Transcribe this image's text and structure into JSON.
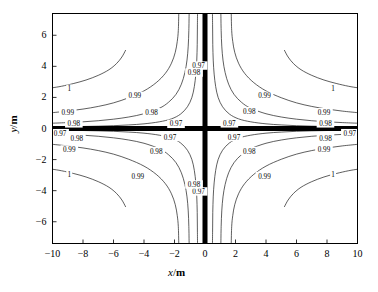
{
  "chart_data": {
    "type": "line",
    "subtype": "contour",
    "title": "",
    "xlabel": "x/m",
    "ylabel": "y/m",
    "xlabel_var": "x",
    "xlabel_sep": "/",
    "xlabel_unit": "m",
    "ylabel_var": "y",
    "ylabel_sep": "/",
    "ylabel_unit": "m",
    "xlim": [
      -10,
      10
    ],
    "ylim": [
      -7.4,
      7.4
    ],
    "xticks": [
      -10,
      -8,
      -6,
      -4,
      -2,
      0,
      2,
      4,
      6,
      8,
      10
    ],
    "xtick_labels": [
      "−10",
      "−8",
      "−6",
      "−4",
      "−2",
      "0",
      "2",
      "4",
      "6",
      "8",
      "10"
    ],
    "yticks": [
      -6,
      -4,
      -2,
      0,
      2,
      4,
      6
    ],
    "ytick_labels": [
      "−6",
      "−4",
      "−2",
      "0",
      "2",
      "4",
      "6"
    ],
    "grid": false,
    "legend": false,
    "tick_direction": "in",
    "contour_levels": [
      1,
      0.99,
      0.98,
      0.97
    ],
    "contour_level_labels": [
      "1",
      "0.99",
      "0.98",
      "0.97"
    ],
    "inline_labels": [
      {
        "text": "1",
        "x": -8.9,
        "y": 2.55
      },
      {
        "text": "0.99",
        "x": -9.0,
        "y": 1.05
      },
      {
        "text": "0.98",
        "x": -8.6,
        "y": 0.33
      },
      {
        "text": "0.97",
        "x": -9.5,
        "y": -0.3
      },
      {
        "text": "0.98",
        "x": -8.4,
        "y": -0.62
      },
      {
        "text": "0.99",
        "x": -8.9,
        "y": -1.35
      },
      {
        "text": "1",
        "x": -8.9,
        "y": -2.95
      },
      {
        "text": "0.99",
        "x": -4.6,
        "y": 2.1
      },
      {
        "text": "0.98",
        "x": -3.5,
        "y": 1.05
      },
      {
        "text": "0.97",
        "x": -1.9,
        "y": 0.3
      },
      {
        "text": "0.97",
        "x": -2.3,
        "y": -0.55
      },
      {
        "text": "0.98",
        "x": -3.2,
        "y": -1.45
      },
      {
        "text": "0.99",
        "x": -4.4,
        "y": -3.05
      },
      {
        "text": "0.99",
        "x": 3.9,
        "y": 2.1
      },
      {
        "text": "0.98",
        "x": 2.9,
        "y": 1.12
      },
      {
        "text": "0.97",
        "x": 1.6,
        "y": 0.33
      },
      {
        "text": "0.97",
        "x": 1.9,
        "y": -0.55
      },
      {
        "text": "0.98",
        "x": 2.9,
        "y": -1.45
      },
      {
        "text": "0.99",
        "x": 3.9,
        "y": -3.05
      },
      {
        "text": "0.99",
        "x": 7.8,
        "y": 1.05
      },
      {
        "text": "0.98",
        "x": 7.9,
        "y": 0.33
      },
      {
        "text": "0.98",
        "x": 7.9,
        "y": -0.62
      },
      {
        "text": "0.99",
        "x": 7.8,
        "y": -1.35
      },
      {
        "text": "1",
        "x": 8.4,
        "y": 2.55
      },
      {
        "text": "1",
        "x": 8.4,
        "y": -2.95
      },
      {
        "text": "0.97",
        "x": 9.5,
        "y": -0.3
      },
      {
        "text": "0.97",
        "x": -0.42,
        "y": 4.05
      },
      {
        "text": "0.97",
        "x": -0.42,
        "y": -4.05
      },
      {
        "text": "0.98",
        "x": -0.72,
        "y": 3.6
      },
      {
        "text": "0.98",
        "x": -0.72,
        "y": -3.6
      }
    ],
    "heavy_axes": {
      "horizontal_y": 0,
      "vertical_x": 0,
      "description": "thick black coordinate axes drawn at x=0 and y=0"
    },
    "series": [
      {
        "name": "level 1 (quadrant II)",
        "level": 1,
        "points": [
          [
            -10,
            2.62
          ],
          [
            -9.4,
            2.72
          ],
          [
            -8.6,
            2.9
          ],
          [
            -7.8,
            3.12
          ],
          [
            -7.0,
            3.42
          ],
          [
            -6.3,
            3.78
          ],
          [
            -5.8,
            4.18
          ],
          [
            -5.45,
            4.6
          ],
          [
            -5.2,
            5.05
          ]
        ]
      },
      {
        "name": "level 1 (quadrant I)",
        "level": 1,
        "points": [
          [
            10,
            2.62
          ],
          [
            9.4,
            2.72
          ],
          [
            8.6,
            2.9
          ],
          [
            7.8,
            3.12
          ],
          [
            7.0,
            3.42
          ],
          [
            6.3,
            3.78
          ],
          [
            5.8,
            4.18
          ],
          [
            5.45,
            4.6
          ],
          [
            5.2,
            5.05
          ]
        ]
      },
      {
        "name": "level 1 (quadrant III)",
        "level": 1,
        "points": [
          [
            -10,
            -2.62
          ],
          [
            -9.4,
            -2.72
          ],
          [
            -8.6,
            -2.9
          ],
          [
            -7.8,
            -3.12
          ],
          [
            -7.0,
            -3.42
          ],
          [
            -6.3,
            -3.78
          ],
          [
            -5.8,
            -4.18
          ],
          [
            -5.45,
            -4.6
          ],
          [
            -5.2,
            -5.05
          ]
        ]
      },
      {
        "name": "level 1 (quadrant IV)",
        "level": 1,
        "points": [
          [
            10,
            -2.62
          ],
          [
            9.4,
            -2.72
          ],
          [
            8.6,
            -2.9
          ],
          [
            7.8,
            -3.12
          ],
          [
            7.0,
            -3.42
          ],
          [
            6.3,
            -3.78
          ],
          [
            5.8,
            -4.18
          ],
          [
            5.45,
            -4.6
          ],
          [
            5.2,
            -5.05
          ]
        ]
      },
      {
        "name": "level 0.99 (upper-left)",
        "level": 0.99,
        "points": [
          [
            -10,
            1.02
          ],
          [
            -9,
            1.12
          ],
          [
            -8,
            1.25
          ],
          [
            -7,
            1.42
          ],
          [
            -6,
            1.65
          ],
          [
            -5,
            1.98
          ],
          [
            -4,
            2.42
          ],
          [
            -3.2,
            2.95
          ],
          [
            -2.6,
            3.55
          ],
          [
            -2.2,
            4.2
          ],
          [
            -1.95,
            4.9
          ],
          [
            -1.82,
            5.6
          ],
          [
            -1.75,
            6.3
          ],
          [
            -1.72,
            7.4
          ]
        ]
      },
      {
        "name": "level 0.99 (upper-right)",
        "level": 0.99,
        "points": [
          [
            10,
            1.02
          ],
          [
            9,
            1.12
          ],
          [
            8,
            1.25
          ],
          [
            7,
            1.42
          ],
          [
            6,
            1.65
          ],
          [
            5,
            1.98
          ],
          [
            4,
            2.42
          ],
          [
            3.2,
            2.95
          ],
          [
            2.6,
            3.55
          ],
          [
            2.2,
            4.2
          ],
          [
            1.95,
            4.9
          ],
          [
            1.82,
            5.6
          ],
          [
            1.75,
            6.3
          ],
          [
            1.72,
            7.4
          ]
        ]
      },
      {
        "name": "level 0.99 (lower-left)",
        "level": 0.99,
        "points": [
          [
            -10,
            -1.02
          ],
          [
            -9,
            -1.12
          ],
          [
            -8,
            -1.25
          ],
          [
            -7,
            -1.42
          ],
          [
            -6,
            -1.65
          ],
          [
            -5,
            -1.98
          ],
          [
            -4,
            -2.42
          ],
          [
            -3.2,
            -2.95
          ],
          [
            -2.6,
            -3.55
          ],
          [
            -2.2,
            -4.2
          ],
          [
            -1.95,
            -4.9
          ],
          [
            -1.82,
            -5.6
          ],
          [
            -1.75,
            -6.3
          ],
          [
            -1.72,
            -7.4
          ]
        ]
      },
      {
        "name": "level 0.99 (lower-right)",
        "level": 0.99,
        "points": [
          [
            10,
            -1.02
          ],
          [
            9,
            -1.12
          ],
          [
            8,
            -1.25
          ],
          [
            7,
            -1.42
          ],
          [
            6,
            -1.65
          ],
          [
            5,
            -1.98
          ],
          [
            4,
            -2.42
          ],
          [
            3.2,
            -2.95
          ],
          [
            2.6,
            -3.55
          ],
          [
            2.2,
            -4.2
          ],
          [
            1.95,
            -4.9
          ],
          [
            1.82,
            -5.6
          ],
          [
            1.75,
            -6.3
          ],
          [
            1.72,
            -7.4
          ]
        ]
      },
      {
        "name": "level 0.98 (upper-left)",
        "level": 0.98,
        "points": [
          [
            -10,
            0.34
          ],
          [
            -9,
            0.38
          ],
          [
            -8,
            0.43
          ],
          [
            -7,
            0.5
          ],
          [
            -6,
            0.6
          ],
          [
            -5,
            0.74
          ],
          [
            -4,
            0.95
          ],
          [
            -3,
            1.3
          ],
          [
            -2.4,
            1.68
          ],
          [
            -1.9,
            2.2
          ],
          [
            -1.55,
            2.85
          ],
          [
            -1.32,
            3.6
          ],
          [
            -1.18,
            4.4
          ],
          [
            -1.1,
            5.3
          ],
          [
            -1.06,
            6.3
          ],
          [
            -1.04,
            7.4
          ]
        ]
      },
      {
        "name": "level 0.98 (upper-right)",
        "level": 0.98,
        "points": [
          [
            10,
            0.34
          ],
          [
            9,
            0.38
          ],
          [
            8,
            0.43
          ],
          [
            7,
            0.5
          ],
          [
            6,
            0.6
          ],
          [
            5,
            0.74
          ],
          [
            4,
            0.95
          ],
          [
            3,
            1.3
          ],
          [
            2.4,
            1.68
          ],
          [
            1.9,
            2.2
          ],
          [
            1.55,
            2.85
          ],
          [
            1.32,
            3.6
          ],
          [
            1.18,
            4.4
          ],
          [
            1.1,
            5.3
          ],
          [
            1.06,
            6.3
          ],
          [
            1.04,
            7.4
          ]
        ]
      },
      {
        "name": "level 0.98 (lower-left)",
        "level": 0.98,
        "points": [
          [
            -10,
            -0.34
          ],
          [
            -9,
            -0.38
          ],
          [
            -8,
            -0.43
          ],
          [
            -7,
            -0.5
          ],
          [
            -6,
            -0.6
          ],
          [
            -5,
            -0.74
          ],
          [
            -4,
            -0.95
          ],
          [
            -3,
            -1.3
          ],
          [
            -2.4,
            -1.68
          ],
          [
            -1.9,
            -2.2
          ],
          [
            -1.55,
            -2.85
          ],
          [
            -1.32,
            -3.6
          ],
          [
            -1.18,
            -4.4
          ],
          [
            -1.1,
            -5.3
          ],
          [
            -1.06,
            -6.3
          ],
          [
            -1.04,
            -7.4
          ]
        ]
      },
      {
        "name": "level 0.98 (lower-right)",
        "level": 0.98,
        "points": [
          [
            10,
            -0.34
          ],
          [
            9,
            -0.38
          ],
          [
            8,
            -0.43
          ],
          [
            7,
            -0.5
          ],
          [
            6,
            -0.6
          ],
          [
            5,
            -0.74
          ],
          [
            4,
            -0.95
          ],
          [
            3,
            -1.3
          ],
          [
            2.4,
            -1.68
          ],
          [
            1.9,
            -2.2
          ],
          [
            1.55,
            -2.85
          ],
          [
            1.32,
            -3.6
          ],
          [
            1.18,
            -4.4
          ],
          [
            1.1,
            -5.3
          ],
          [
            1.06,
            -6.3
          ],
          [
            1.04,
            -7.4
          ]
        ]
      },
      {
        "name": "level 0.97 (upper-left)",
        "level": 0.97,
        "points": [
          [
            -10,
            0.1
          ],
          [
            -9,
            0.11
          ],
          [
            -8,
            0.13
          ],
          [
            -7,
            0.15
          ],
          [
            -6,
            0.18
          ],
          [
            -5,
            0.23
          ],
          [
            -4,
            0.3
          ],
          [
            -3,
            0.43
          ],
          [
            -2.2,
            0.62
          ],
          [
            -1.6,
            0.93
          ],
          [
            -1.15,
            1.4
          ],
          [
            -0.86,
            2.0
          ],
          [
            -0.7,
            2.7
          ],
          [
            -0.6,
            3.5
          ],
          [
            -0.54,
            4.4
          ],
          [
            -0.51,
            5.4
          ],
          [
            -0.5,
            6.4
          ],
          [
            -0.49,
            7.4
          ]
        ]
      },
      {
        "name": "level 0.97 (upper-right)",
        "level": 0.97,
        "points": [
          [
            10,
            0.1
          ],
          [
            9,
            0.11
          ],
          [
            8,
            0.13
          ],
          [
            7,
            0.15
          ],
          [
            6,
            0.18
          ],
          [
            5,
            0.23
          ],
          [
            4,
            0.3
          ],
          [
            3,
            0.43
          ],
          [
            2.2,
            0.62
          ],
          [
            1.6,
            0.93
          ],
          [
            1.15,
            1.4
          ],
          [
            0.86,
            2.0
          ],
          [
            0.7,
            2.7
          ],
          [
            0.6,
            3.5
          ],
          [
            0.54,
            4.4
          ],
          [
            0.51,
            5.4
          ],
          [
            0.5,
            6.4
          ],
          [
            0.49,
            7.4
          ]
        ]
      },
      {
        "name": "level 0.97 (lower-left)",
        "level": 0.97,
        "points": [
          [
            -10,
            -0.1
          ],
          [
            -9,
            -0.11
          ],
          [
            -8,
            -0.13
          ],
          [
            -7,
            -0.15
          ],
          [
            -6,
            -0.18
          ],
          [
            -5,
            -0.23
          ],
          [
            -4,
            -0.3
          ],
          [
            -3,
            -0.43
          ],
          [
            -2.2,
            -0.62
          ],
          [
            -1.6,
            -0.93
          ],
          [
            -1.15,
            -1.4
          ],
          [
            -0.86,
            -2.0
          ],
          [
            -0.7,
            -2.7
          ],
          [
            -0.6,
            -3.5
          ],
          [
            -0.54,
            -4.4
          ],
          [
            -0.51,
            -5.4
          ],
          [
            -0.5,
            -6.4
          ],
          [
            -0.49,
            -7.4
          ]
        ]
      },
      {
        "name": "level 0.97 (lower-right)",
        "level": 0.97,
        "points": [
          [
            10,
            -0.1
          ],
          [
            9,
            -0.11
          ],
          [
            8,
            -0.13
          ],
          [
            7,
            -0.15
          ],
          [
            6,
            -0.18
          ],
          [
            5,
            -0.23
          ],
          [
            4,
            -0.3
          ],
          [
            3,
            -0.43
          ],
          [
            2.2,
            -0.62
          ],
          [
            1.6,
            -0.93
          ],
          [
            1.15,
            -1.4
          ],
          [
            0.86,
            -2.0
          ],
          [
            0.7,
            -2.7
          ],
          [
            0.6,
            -3.5
          ],
          [
            0.54,
            -4.4
          ],
          [
            0.51,
            -5.4
          ],
          [
            0.5,
            -6.4
          ],
          [
            0.49,
            -7.4
          ]
        ]
      }
    ]
  }
}
